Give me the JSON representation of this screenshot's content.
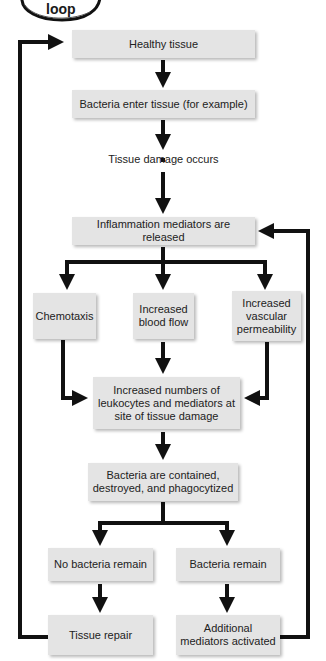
{
  "header": {
    "badge_label": "loop"
  },
  "nodes": {
    "healthy": "Healthy tissue",
    "bacteria_enter": "Bacteria enter tissue (for example)",
    "tissue_damage": "Tissue damage occurs",
    "mediators_released": "Inflammation mediators are released",
    "chemotaxis": "Chemotaxis",
    "blood_flow": "Increased blood flow",
    "permeability": "Increased vascular permeability",
    "leukocytes": "Increased numbers of leukocytes and mediators at site of tissue damage",
    "contained": "Bacteria are contained, destroyed, and phagocytized",
    "no_bacteria": "No bacteria remain",
    "bacteria_remain": "Bacteria remain",
    "tissue_repair": "Tissue repair",
    "additional_mediators": "Additional mediators activated"
  },
  "colors": {
    "box_fill": "#e4e4e4",
    "arrow": "#111111"
  }
}
